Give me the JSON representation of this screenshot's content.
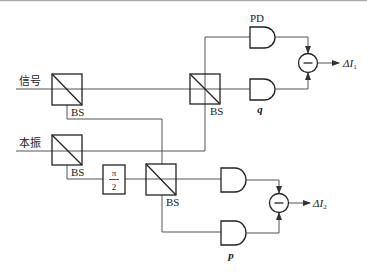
{
  "diagram": {
    "type": "balanced homodyne detection optical setup",
    "inputs": {
      "signal": "信号",
      "local_oscillator": "本振"
    },
    "beam_splitters": [
      {
        "id": "bs1",
        "label": "BS"
      },
      {
        "id": "bs2",
        "label": "BS"
      },
      {
        "id": "bs3",
        "label": "BS"
      },
      {
        "id": "bs4",
        "label": "BS"
      }
    ],
    "phase_shifter": {
      "numerator": "π",
      "denominator": "2"
    },
    "detectors": {
      "pd_label": "PD",
      "quadrature_q": "q",
      "quadrature_p": "p"
    },
    "subtractors": [
      {
        "symbol": "−",
        "output": "ΔI",
        "subscript": "1"
      },
      {
        "symbol": "−",
        "output": "ΔI",
        "subscript": "2"
      }
    ],
    "colors": {
      "line": "#333333",
      "beam": "#555555",
      "background": "#ffffff",
      "top_rule": "#aaaaaa"
    }
  }
}
